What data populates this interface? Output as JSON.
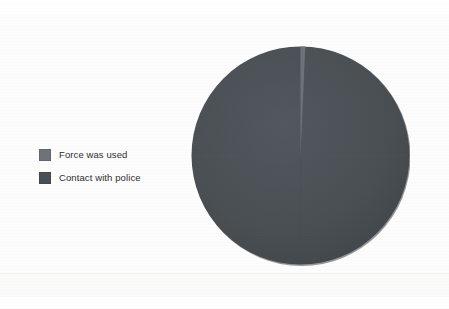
{
  "chart_data": {
    "type": "pie",
    "title": "",
    "subtitle": "",
    "labels": [
      "Force was used",
      "Contact with police"
    ],
    "values": [
      0.7,
      99.3
    ],
    "units": "percent",
    "colors": [
      "#6e737a",
      "#4a4f54"
    ],
    "legend_position": "left",
    "grid": false,
    "start_angle_deg": 0,
    "direction": "clockwise",
    "annotations": []
  },
  "legend": {
    "items": [
      {
        "label": "Force was used",
        "color": "#6e737a"
      },
      {
        "label": "Contact with police",
        "color": "#4a4f54"
      }
    ]
  },
  "pie": {
    "center_x": 109.5,
    "center_y": 110.5,
    "radius": 109,
    "slices": [
      {
        "name": "Force was used",
        "percent": 0.7,
        "color": "#6e737a"
      },
      {
        "name": "Contact with police",
        "percent": 99.3,
        "color": "#4a4f54"
      }
    ]
  },
  "colors": {
    "background": "#fdfdfd",
    "slice_major": "#4a4f54",
    "slice_minor": "#6e737a",
    "text": "#2e2e2e"
  }
}
